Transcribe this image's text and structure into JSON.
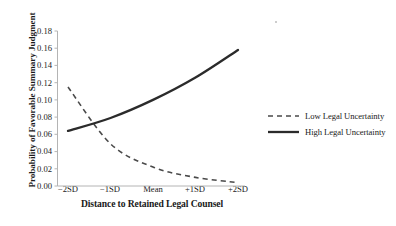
{
  "chart_data": {
    "type": "line",
    "title": "",
    "xlabel": "Distance to Retained Legal Counsel",
    "ylabel": "Probability of Favorable Summary Judgment",
    "categories": [
      "−2SD",
      "−1SD",
      "Mean",
      "+1SD",
      "+2SD"
    ],
    "x": [
      -2,
      -1,
      0,
      1,
      2
    ],
    "xlim": [
      -2,
      2
    ],
    "ylim": [
      0.0,
      0.18
    ],
    "yticks": [
      "0.00",
      "0.02",
      "0.04",
      "0.06",
      "0.08",
      "0.10",
      "0.12",
      "0.14",
      "0.16",
      "0.18"
    ],
    "ytick_values": [
      0.0,
      0.02,
      0.04,
      0.06,
      0.08,
      0.1,
      0.12,
      0.14,
      0.16,
      0.18
    ],
    "grid": false,
    "legend_position": "right",
    "series": [
      {
        "name": "Low Legal Uncertainty",
        "style": "dashed",
        "color": "#4a4a4a",
        "values": [
          0.115,
          0.049,
          0.022,
          0.01,
          0.004
        ]
      },
      {
        "name": "High Legal Uncertainty",
        "style": "solid",
        "color": "#2b2b2b",
        "values": [
          0.064,
          0.079,
          0.1,
          0.126,
          0.158
        ]
      }
    ],
    "crossing_point": {
      "x": -1.45,
      "y": 0.075
    }
  },
  "axis": {
    "y_title": "Probability of Favorable Summary Judgment",
    "x_title": "Distance to Retained Legal Counsel"
  },
  "legend": {
    "items": [
      {
        "label": "Low Legal Uncertainty",
        "style": "dashed"
      },
      {
        "label": "High Legal Uncertainty",
        "style": "solid"
      }
    ]
  }
}
